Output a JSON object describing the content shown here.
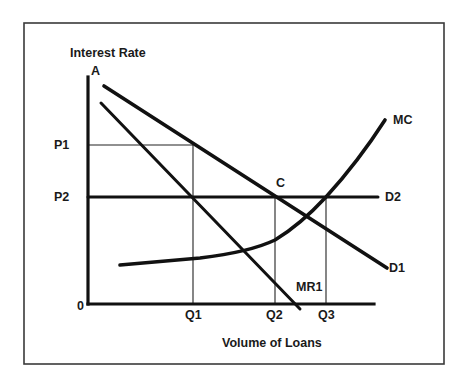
{
  "diagram": {
    "y_axis_label": "Interest Rate",
    "x_axis_label": "Volume of Loans",
    "origin_label": "0",
    "point_labels": {
      "a": "A",
      "c": "C"
    },
    "price_labels": {
      "p1": "P1",
      "p2": "P2"
    },
    "quantity_labels": {
      "q1": "Q1",
      "q2": "Q2",
      "q3": "Q3"
    },
    "curve_labels": {
      "mc": "MC",
      "d1": "D1",
      "d2": "D2",
      "mr1": "MR1"
    },
    "colors": {
      "line": "#111111",
      "frame": "#3a3a3a",
      "background": "#ffffff"
    }
  }
}
